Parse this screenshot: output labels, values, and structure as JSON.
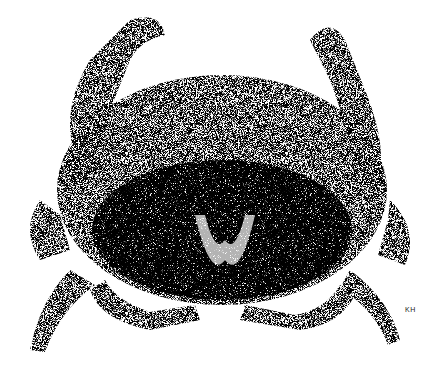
{
  "illustration": {
    "subject": "crab",
    "style": "stipple",
    "signature": "KH",
    "ink_color": "#1a1a1a",
    "paper_color": "#ffffff"
  }
}
